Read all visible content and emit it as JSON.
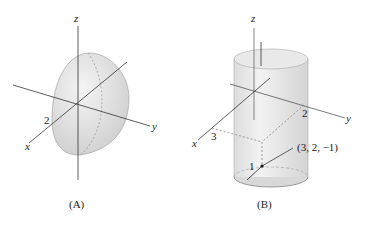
{
  "figures": [
    {
      "id": "A",
      "caption": "(A)",
      "shape": "hemisphere",
      "axes": {
        "x": "x",
        "y": "y",
        "z": "z"
      },
      "tick_labels": {
        "x_axis": "2"
      }
    },
    {
      "id": "B",
      "caption": "(B)",
      "shape": "cylinder",
      "axes": {
        "x": "x",
        "y": "y",
        "z": "z"
      },
      "tick_labels": {
        "x_axis": "3",
        "y_axis": "2",
        "radius": "1"
      },
      "point_label": "(3, 2, −1)"
    }
  ]
}
